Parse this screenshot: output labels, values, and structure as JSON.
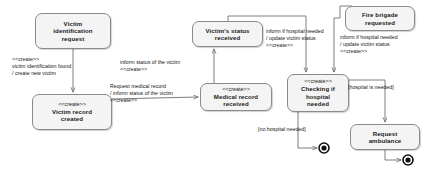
{
  "diagram": {
    "type": "uml-state-machine",
    "colors": {
      "box_fill": "#f4f4f4",
      "box_border": "#8a8a8a",
      "line": "#6f6f6f",
      "text": "#1a1a1a",
      "final_state": "#111111"
    },
    "states": [
      {
        "id": "victim-identification-request",
        "stereotype": "",
        "name": "Victim\nidentification\nrequest",
        "x": 35,
        "y": 13,
        "w": 76,
        "h": 36
      },
      {
        "id": "victim-record-created",
        "stereotype": "<<create>>",
        "name": "Victim record\ncreated",
        "x": 32,
        "y": 94,
        "w": 80,
        "h": 36
      },
      {
        "id": "medical-record-received",
        "stereotype": "<<create>>",
        "name": "Medical record\nreceived",
        "x": 200,
        "y": 83,
        "w": 72,
        "h": 28
      },
      {
        "id": "victims-status-received",
        "stereotype": "",
        "name": "Victim's status\nreceived",
        "x": 192,
        "y": 21,
        "w": 71,
        "h": 26
      },
      {
        "id": "fire-brigade-requested",
        "stereotype": "",
        "name": "Fire brigade\nrequested",
        "x": 345,
        "y": 6,
        "w": 70,
        "h": 25
      },
      {
        "id": "checking-if-hospital-needed",
        "stereotype": "<<create>>",
        "name": "Checking if\nhospital\nneeded",
        "x": 287,
        "y": 74,
        "w": 62,
        "h": 38
      },
      {
        "id": "request-ambulance",
        "stereotype": "",
        "name": "Request\nambulance",
        "x": 350,
        "y": 124,
        "w": 70,
        "h": 26
      }
    ],
    "final_states": [
      {
        "id": "final-no-hospital",
        "cx": 324,
        "cy": 148,
        "r_outer": 5,
        "r_inner": 2.6
      },
      {
        "id": "final-ambulance",
        "cx": 408,
        "cy": 160,
        "r_outer": 5,
        "r_inner": 2.6
      }
    ],
    "transitions": [
      {
        "id": "t-identification-to-record",
        "from": "victim-identification-request",
        "to": "victim-record-created",
        "label": "<<create>>\nvictim identification found\n/ create new victim",
        "label_x": 12,
        "label_y": 56,
        "align": "left"
      },
      {
        "id": "t-record-to-medical",
        "from": "victim-record-created",
        "to": "medical-record-received",
        "label": "Request medical record\n/ inform status of the victim\n<<create>>",
        "label_x": 110,
        "label_y": 83,
        "align": "left"
      },
      {
        "id": "t-medical-to-status",
        "from": "medical-record-received",
        "to": "victims-status-received",
        "label": "inform status of the victim\n<<create>>",
        "label_x": 182,
        "label_y": 59,
        "align": "left"
      },
      {
        "id": "t-status-to-checking",
        "from": "victims-status-received",
        "to": "checking-if-hospital-needed",
        "label": "inform if hospital needed\n/ update victim status\n<<create>>",
        "label_x": 268,
        "label_y": 30,
        "align": "left"
      },
      {
        "id": "t-firebrigade-to-checking",
        "from": "fire-brigade-requested",
        "to": "checking-if-hospital-needed",
        "label": "inform if hospital needed\n/ update victim status\n<<create>>",
        "label_x": 340,
        "label_y": 34,
        "align": "left"
      },
      {
        "id": "t-checking-to-ambulance",
        "from": "checking-if-hospital-needed",
        "to": "request-ambulance",
        "label": "[hospital is needed]",
        "label_x": 352,
        "label_y": 84,
        "align": "left"
      },
      {
        "id": "t-checking-to-final",
        "from": "checking-if-hospital-needed",
        "to": "final-no-hospital",
        "label": "[no hospital needed]",
        "label_x": 262,
        "label_y": 126,
        "align": "left"
      },
      {
        "id": "t-ambulance-to-final",
        "from": "request-ambulance",
        "to": "final-ambulance",
        "label": "",
        "label_x": 0,
        "label_y": 0,
        "align": "left"
      }
    ]
  }
}
